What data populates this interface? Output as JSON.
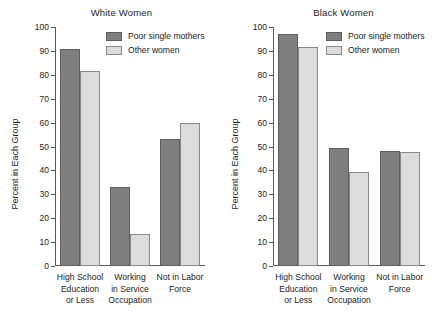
{
  "chart_data": [
    {
      "type": "bar",
      "title": "White Women",
      "xlabel": "",
      "ylabel": "Percent in Each Group",
      "ylim": [
        0,
        100
      ],
      "ytick_step": 10,
      "yticks": [
        0,
        10,
        20,
        30,
        40,
        50,
        60,
        70,
        80,
        90,
        100
      ],
      "grid": false,
      "legend_position": "top-right",
      "categories": [
        [
          "High School",
          "Education",
          "or Less"
        ],
        [
          "Working",
          "in Service",
          "Occupation"
        ],
        [
          "Not in Labor",
          "Force"
        ]
      ],
      "series": [
        {
          "name": "Poor single mothers",
          "color": "#807f7f",
          "values": [
            91,
            33,
            53
          ]
        },
        {
          "name": "Other women",
          "color": "#dcdcdc",
          "values": [
            81.5,
            13.5,
            60
          ]
        }
      ]
    },
    {
      "type": "bar",
      "title": "Black Women",
      "xlabel": "",
      "ylabel": "Percent in Each Group",
      "ylim": [
        0,
        100
      ],
      "ytick_step": 10,
      "yticks": [
        0,
        10,
        20,
        30,
        40,
        50,
        60,
        70,
        80,
        90,
        100
      ],
      "grid": false,
      "legend_position": "top-right",
      "categories": [
        [
          "High School",
          "Education",
          "or Less"
        ],
        [
          "Working",
          "in Service",
          "Occupation"
        ],
        [
          "Not in Labor",
          "Force"
        ]
      ],
      "series": [
        {
          "name": "Poor single mothers",
          "color": "#807f7f",
          "values": [
            97,
            49.5,
            48
          ]
        },
        {
          "name": "Other women",
          "color": "#dcdcdc",
          "values": [
            91.5,
            39.5,
            47.5
          ]
        }
      ]
    }
  ]
}
